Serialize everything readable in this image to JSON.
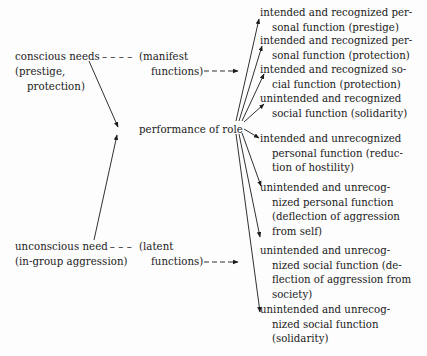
{
  "diagram": {
    "left": {
      "conscious": {
        "line1": "conscious needs",
        "dashes": "– – – –",
        "line2": "(prestige,",
        "line3": "protection)"
      },
      "manifest": {
        "line1": "(manifest",
        "line2": "functions)",
        "dashes": "– – –"
      },
      "unconscious": {
        "line1": "unconscious need",
        "dashes": "– – –",
        "line2": "(in-group aggression)"
      },
      "latent": {
        "line1": "(latent",
        "line2": "functions)",
        "dashes": "– – –"
      }
    },
    "center": {
      "label": "performance of role"
    },
    "functions": [
      {
        "line1": "intended and recognized per-",
        "line2": "sonal function (prestige)"
      },
      {
        "line1": "intended and recognized per-",
        "line2": "sonal function (protection)"
      },
      {
        "line1": "intended and recognized so-",
        "line2": "cial function (protection)"
      },
      {
        "line1": "unintended and recognized",
        "line2": "social function (solidarity)"
      },
      {
        "line1": "intended and unrecognized",
        "line2": "personal function (reduc-",
        "line3": "tion of hostility)"
      },
      {
        "line1": "unintended and unrecog-",
        "line2": "nized personal function",
        "line3": "(deflection of aggression",
        "line4": "from self)"
      },
      {
        "line1": "unintended and unrecog-",
        "line2": "nized social function (de-",
        "line3": "flection of aggression from",
        "line4": "society)"
      },
      {
        "line1": "unintended and unrecog-",
        "line2": "nized social function",
        "line3": "(solidarity)"
      }
    ]
  }
}
